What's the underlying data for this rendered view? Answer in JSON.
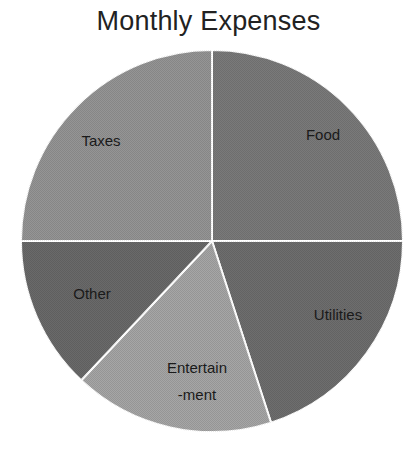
{
  "chart_data": {
    "type": "pie",
    "title": "Monthly Expenses",
    "categories": [
      "Food",
      "Utilities",
      "Entertain-ment",
      "Other",
      "Taxes"
    ],
    "values": [
      25,
      20,
      17,
      13,
      25
    ],
    "unit": "percent (estimated from slice angles)",
    "start_angle_deg": 0,
    "direction": "clockwise",
    "labels_display": [
      {
        "text": "Food",
        "lines": [
          "Food"
        ]
      },
      {
        "text": "Utilities",
        "lines": [
          "Utilities"
        ]
      },
      {
        "text": "Entertain-ment",
        "lines": [
          "Entertain",
          "-ment"
        ]
      },
      {
        "text": "Other",
        "lines": [
          "Other"
        ]
      },
      {
        "text": "Taxes",
        "lines": [
          "Taxes"
        ]
      }
    ],
    "colors": [
      "#7a7a7a",
      "#6e6e6e",
      "#a6a6a6",
      "#6a6a6a",
      "#959595"
    ],
    "legend": "none",
    "data_labels": "category names inside slices"
  }
}
